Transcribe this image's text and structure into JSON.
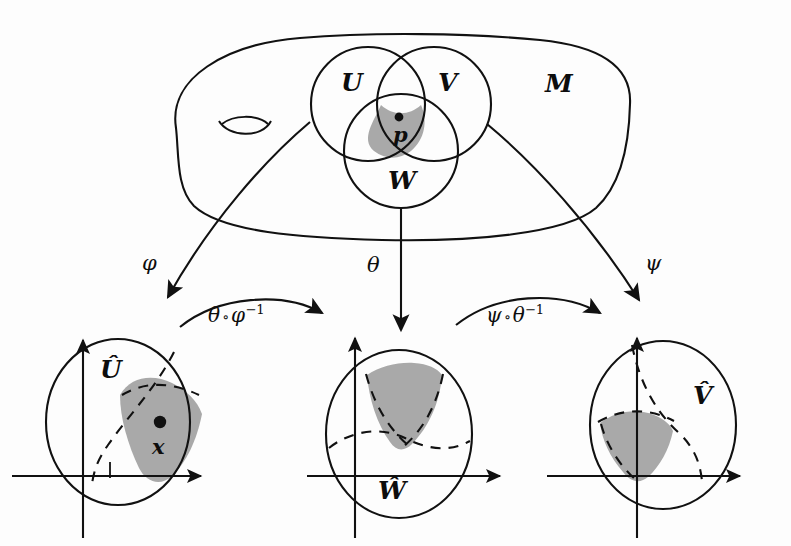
{
  "figure": {
    "kind": "manifold-charts-diagram",
    "ink_color": "#111111",
    "shade_color": "#a9a9a9",
    "background_color": "#fdfdfd"
  },
  "manifold": {
    "label": "M",
    "handle_name": "genus-handle"
  },
  "patches": [
    {
      "id": "U",
      "label": "U"
    },
    {
      "id": "V",
      "label": "V"
    },
    {
      "id": "W",
      "label": "W"
    }
  ],
  "marked_points": {
    "manifold_point": "p",
    "chart_point": "x"
  },
  "chart_maps": [
    {
      "id": "phi",
      "label": "φ",
      "from": "U",
      "to": "U-hat"
    },
    {
      "id": "theta",
      "label": "θ",
      "from": "W",
      "to": "W-hat"
    },
    {
      "id": "psi",
      "label": "ψ",
      "from": "V",
      "to": "V-hat"
    }
  ],
  "transition_maps": [
    {
      "id": "theta-after-phi-inverse",
      "base": "θ",
      "compose": "∘",
      "second": "φ",
      "exponent": "−1"
    },
    {
      "id": "psi-after-theta-inverse",
      "base": "ψ",
      "compose": "∘",
      "second": "θ",
      "exponent": "−1"
    }
  ],
  "charts": [
    {
      "id": "U-hat",
      "label": "Û",
      "shaded_region": "image-of-triple-overlap",
      "has_marked_point": true
    },
    {
      "id": "W-hat",
      "label": "Ŵ",
      "shaded_region": "image-of-triple-overlap",
      "has_marked_point": false
    },
    {
      "id": "V-hat",
      "label": "V̂",
      "shaded_region": "image-of-triple-overlap",
      "has_marked_point": false
    }
  ]
}
